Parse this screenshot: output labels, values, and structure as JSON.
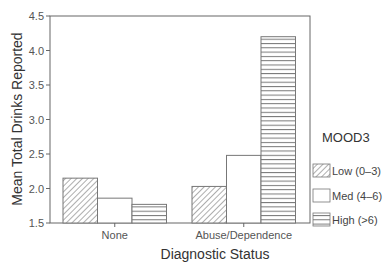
{
  "chart_data": {
    "type": "bar",
    "title": "",
    "xlabel": "Diagnostic Status",
    "ylabel": "Mean Total Drinks Reported",
    "categories": [
      "None",
      "Abuse/Dependence"
    ],
    "series": [
      {
        "name": "Low (0-3)",
        "pattern": "diagonal-hatch",
        "values": [
          2.15,
          2.03
        ]
      },
      {
        "name": "Med (4-6)",
        "pattern": "none",
        "values": [
          1.86,
          2.48
        ]
      },
      {
        "name": "High (>6)",
        "pattern": "horizontal-lines",
        "values": [
          1.77,
          4.2
        ]
      }
    ],
    "ylim": [
      1.5,
      4.5
    ],
    "yticks": [
      "1.5",
      "2.0",
      "2.5",
      "3.0",
      "3.5",
      "4.0",
      "4.5"
    ],
    "grid": false,
    "legend": {
      "title": "MOOD3",
      "position": "right"
    }
  },
  "labels": {
    "xlabel": "Diagnostic Status",
    "ylabel": "Mean Total Drinks Reported",
    "legend_title": "MOOD3",
    "legend_items": [
      "Low (0–3)",
      "Med (4–6)",
      "High (>6)"
    ],
    "categories": [
      "None",
      "Abuse/Dependence"
    ]
  },
  "colors": {
    "axis": "#555555",
    "bar_stroke": "#666666",
    "fill": "#ffffff"
  }
}
